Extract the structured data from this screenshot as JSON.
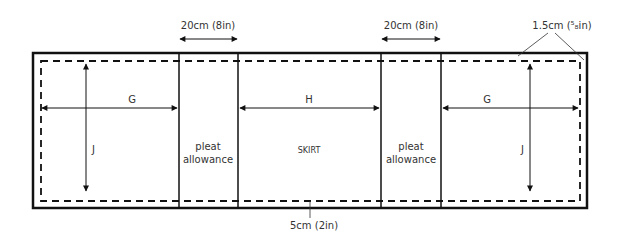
{
  "diagram": {
    "top_dimensions": [
      {
        "id": "pleat1",
        "label": "20cm (8in)"
      },
      {
        "id": "pleat2",
        "label": "20cm (8in)"
      }
    ],
    "seam_allowance_label": "1.5cm (⁵₈in)",
    "hem_label": "5cm (2in)",
    "panels": [
      {
        "id": "left",
        "width_label": "G",
        "height_label": "J"
      },
      {
        "id": "pleat_left",
        "text_line1": "pleat",
        "text_line2": "allowance"
      },
      {
        "id": "center",
        "width_label": "H",
        "text": "SKIRT"
      },
      {
        "id": "pleat_right",
        "text_line1": "pleat",
        "text_line2": "allowance"
      },
      {
        "id": "right",
        "width_label": "G",
        "height_label": "J"
      }
    ],
    "colors": {
      "line": "#111111",
      "text": "#333333",
      "background": "#ffffff"
    }
  }
}
